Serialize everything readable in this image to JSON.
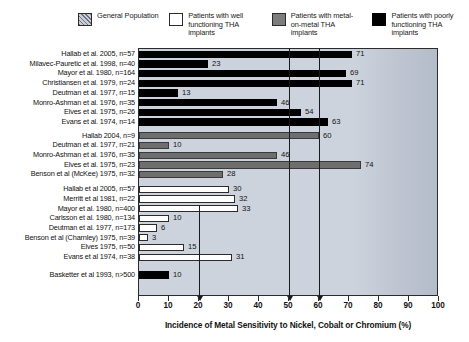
{
  "legend": {
    "items": [
      {
        "label": "General Population",
        "swatch": "general-population-swatch",
        "color": "#8a8f99"
      },
      {
        "label": "Patients with well functioning THA implants",
        "swatch": "white-swatch",
        "color": "#ffffff"
      },
      {
        "label": "Patients with metal-on-metal THA implants",
        "swatch": "gray-swatch",
        "color": "#7d7d7d"
      },
      {
        "label": "Patients with poorly functioning THA implants",
        "swatch": "black-swatch",
        "color": "#000000"
      }
    ]
  },
  "axis": {
    "x_label": "Incidence of Metal Sensitivity to Nickel, Cobalt or Chromium (%)",
    "ticks": [
      "0",
      "10",
      "20",
      "30",
      "40",
      "50",
      "60",
      "70",
      "80",
      "90",
      "100"
    ],
    "min": 0,
    "max": 100
  },
  "annotations": {
    "arrow_positions": [
      20,
      50,
      60
    ]
  },
  "chart_data": {
    "type": "bar",
    "orientation": "horizontal",
    "title": "",
    "xlabel": "Incidence of Metal Sensitivity to Nickel, Cobalt or Chromium (%)",
    "ylabel": "",
    "xlim": [
      0,
      100
    ],
    "grid": false,
    "legend_position": "top",
    "groups": [
      {
        "name": "Patients with poorly functioning THA implants",
        "color": "#000000",
        "style": "black",
        "categories": [
          "Hallab et al. 2005, n=57",
          "Milavec-Pauretic et al. 1998, n=40",
          "Mayor et al. 1980, n=164",
          "Christiansen et al. 1979, n=24",
          "Deutman et al. 1977, n=15",
          "Monro-Ashman et al. 1976, n=35",
          "Elves et al. 1975, n=26",
          "Evans et al. 1974, n=14"
        ],
        "values": [
          71,
          23,
          69,
          71,
          13,
          46,
          54,
          63
        ]
      },
      {
        "name": "Patients with metal-on-metal THA implants",
        "color": "#6e6e6e",
        "style": "gray",
        "categories": [
          "Hallab 2004, n=9",
          "Deutman et al. 1977, n=21",
          "Monro-Ashman et al. 1976, n=35",
          "Elves et al. 1975, n=23",
          "Benson et al (McKee) 1975, n=32"
        ],
        "values": [
          60,
          10,
          46,
          74,
          28
        ]
      },
      {
        "name": "Patients with well functioning THA implants",
        "color": "#ffffff",
        "style": "white",
        "categories": [
          "Hallab et al 2005, n=57",
          "Merritt et al 1981, n=22",
          "Mayor et al. 1980, n=400",
          "Carlsson et al. 1980, n=134",
          "Deutman et al. 1977, n=173",
          "Benson et al (Charnley) 1975, n=39",
          "Elves 1975, n=50",
          "Evans et al 1974, n=38"
        ],
        "values": [
          30,
          32,
          33,
          10,
          6,
          3,
          15,
          31
        ]
      },
      {
        "name": "General Population",
        "color": "#000000",
        "style": "general",
        "categories": [
          "Basketter et al 1993, n>500"
        ],
        "values": [
          10
        ]
      }
    ]
  }
}
